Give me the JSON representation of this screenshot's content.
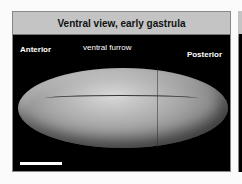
{
  "figure": {
    "title": "Ventral view, early gastrula",
    "labels": {
      "anterior": "Anterior",
      "posterior": "Posterior",
      "furrow": "ventral furrow"
    },
    "colors": {
      "header_bg": "#c4c4c4",
      "panel_bg": "#000000",
      "label": "#ffffff"
    }
  }
}
